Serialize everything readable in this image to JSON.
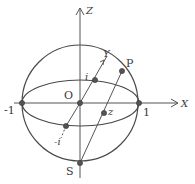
{
  "diagram": {
    "labels": {
      "z_axis": "Z",
      "x_axis": "X",
      "y_axis": "Y",
      "origin": "O",
      "minus_one": "-1",
      "one": "1",
      "i": "i",
      "minus_i": "-i",
      "p": "P",
      "z": "z",
      "s": "S"
    },
    "colors": {
      "stroke": "#4a4a4a",
      "dot": "#555555",
      "background": "#ffffff"
    },
    "geometry": {
      "sphere_center": [
        80,
        103
      ],
      "sphere_radius": 58,
      "equator_rx": 58,
      "equator_ry": 23,
      "points": {
        "O": [
          80,
          103
        ],
        "minus_one": [
          22,
          103
        ],
        "one": [
          139,
          103
        ],
        "i": [
          95,
          80
        ],
        "minus_i": [
          66,
          126
        ],
        "P": [
          122,
          71
        ],
        "z": [
          104,
          113
        ],
        "S": [
          80,
          163
        ]
      }
    }
  }
}
